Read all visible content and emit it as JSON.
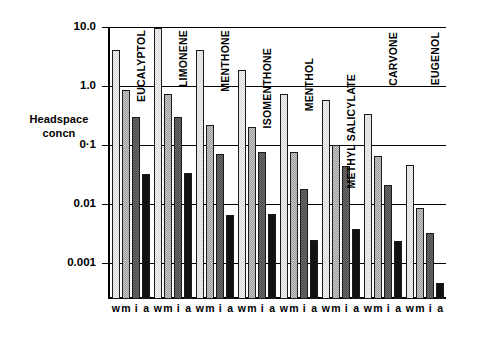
{
  "chart_data": {
    "type": "bar",
    "title": "",
    "xlabel": "",
    "ylabel": "Headspace concn",
    "ylabel_lines": [
      "Headspace",
      "concn"
    ],
    "yscale": "log",
    "ylim": [
      0.0003,
      10.0
    ],
    "ytick_labels": [
      "10.0",
      "1.0",
      "0·1",
      "0.01",
      "0.001"
    ],
    "ytick_values": [
      10.0,
      1.0,
      0.1,
      0.01,
      0.001
    ],
    "grid": true,
    "legend": "none",
    "subgroup_labels": [
      "w",
      "m",
      "i",
      "a"
    ],
    "categories": [
      "EUCALYPTOL",
      "LIMONENE",
      "MENTHONE",
      "ISOMENTHONE",
      "MENTHOL",
      "METHYL SALICYLATE",
      "CARVONE",
      "EUGENOL"
    ],
    "series": [
      {
        "name": "w",
        "shade": "s-w",
        "values": [
          4.0,
          9.5,
          4.0,
          1.9,
          0.72,
          0.57,
          0.34,
          0.045
        ]
      },
      {
        "name": "m",
        "shade": "s-m",
        "values": [
          0.85,
          0.73,
          0.22,
          0.2,
          0.075,
          0.1,
          0.065,
          0.0085
        ]
      },
      {
        "name": "i",
        "shade": "s-i",
        "values": [
          0.3,
          0.3,
          0.07,
          0.075,
          0.018,
          0.044,
          0.021,
          0.0032
        ]
      },
      {
        "name": "a",
        "shade": "s-a",
        "values": [
          0.032,
          0.033,
          0.0065,
          0.0068,
          0.0025,
          0.0038,
          0.0024,
          0.00045
        ]
      }
    ],
    "colors": {
      "series_w": "#d7d7d7",
      "series_m": "#9b9b9b",
      "series_i": "#4a4a4a",
      "series_a": "#111111",
      "axis": "#000000",
      "background": "#ffffff"
    }
  }
}
